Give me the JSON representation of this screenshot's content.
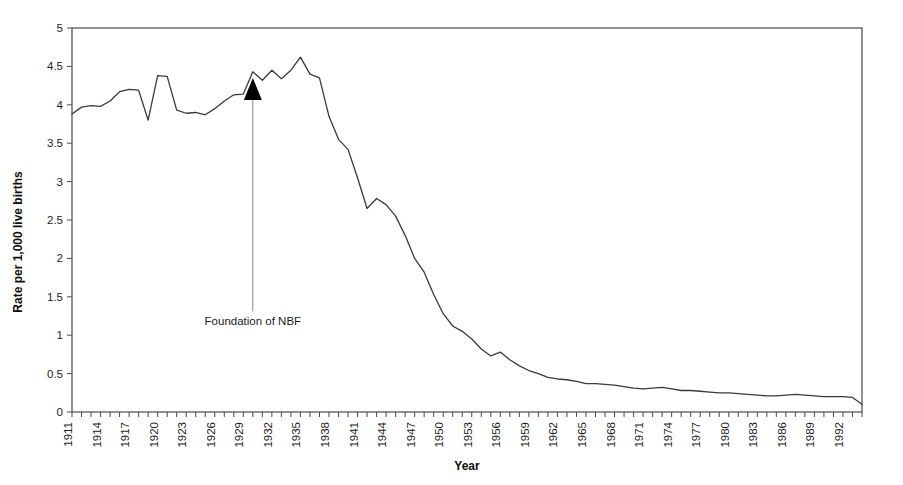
{
  "chart_data": {
    "type": "line",
    "title": "",
    "xlabel": "Year",
    "ylabel": "Rate per 1,000 live births",
    "xlim": [
      1911,
      1994
    ],
    "ylim": [
      0,
      5
    ],
    "grid": false,
    "legend": false,
    "y_ticks": [
      "0",
      "0.5",
      "1",
      "1.5",
      "2",
      "2.5",
      "3",
      "3.5",
      "4",
      "4.5",
      "5"
    ],
    "y_tick_values": [
      0,
      0.5,
      1,
      1.5,
      2,
      2.5,
      3,
      3.5,
      4,
      4.5,
      5
    ],
    "x_tick_labels": [
      "1911",
      "1914",
      "1917",
      "1920",
      "1923",
      "1926",
      "1929",
      "1932",
      "1935",
      "1938",
      "1941",
      "1944",
      "1947",
      "1950",
      "1953",
      "1956",
      "1959",
      "1962",
      "1965",
      "1968",
      "1971",
      "1974",
      "1977",
      "1980",
      "1983",
      "1986",
      "1989",
      "1992"
    ],
    "x_tick_label_step": 3,
    "x_minor_tick_step": 1,
    "series": [
      {
        "name": "Rate per 1,000 live births",
        "color": "#3a3a3a",
        "x": [
          1911,
          1912,
          1913,
          1914,
          1915,
          1916,
          1917,
          1918,
          1919,
          1920,
          1921,
          1922,
          1923,
          1924,
          1925,
          1926,
          1927,
          1928,
          1929,
          1930,
          1931,
          1932,
          1933,
          1934,
          1935,
          1936,
          1937,
          1938,
          1939,
          1940,
          1941,
          1942,
          1943,
          1944,
          1945,
          1946,
          1947,
          1948,
          1949,
          1950,
          1951,
          1952,
          1953,
          1954,
          1955,
          1956,
          1957,
          1958,
          1959,
          1960,
          1961,
          1962,
          1963,
          1964,
          1965,
          1966,
          1967,
          1968,
          1969,
          1970,
          1971,
          1972,
          1973,
          1974,
          1975,
          1976,
          1977,
          1978,
          1979,
          1980,
          1981,
          1982,
          1983,
          1984,
          1985,
          1986,
          1987,
          1988,
          1989,
          1990,
          1991,
          1992,
          1993,
          1994
        ],
        "values": [
          3.88,
          3.97,
          3.99,
          3.98,
          4.05,
          4.17,
          4.2,
          4.19,
          3.8,
          4.38,
          4.37,
          3.93,
          3.89,
          3.9,
          3.87,
          3.95,
          4.05,
          4.13,
          4.14,
          4.43,
          4.32,
          4.45,
          4.34,
          4.45,
          4.62,
          4.4,
          4.35,
          3.85,
          3.55,
          3.42,
          3.05,
          2.65,
          2.78,
          2.7,
          2.55,
          2.3,
          2.0,
          1.82,
          1.53,
          1.28,
          1.12,
          1.05,
          0.95,
          0.82,
          0.73,
          0.78,
          0.68,
          0.6,
          0.54,
          0.5,
          0.45,
          0.43,
          0.42,
          0.4,
          0.37,
          0.37,
          0.36,
          0.35,
          0.33,
          0.31,
          0.3,
          0.31,
          0.32,
          0.3,
          0.28,
          0.28,
          0.27,
          0.26,
          0.25,
          0.25,
          0.24,
          0.23,
          0.22,
          0.21,
          0.21,
          0.22,
          0.23,
          0.22,
          0.21,
          0.2,
          0.2,
          0.2,
          0.19,
          0.1
        ]
      }
    ],
    "annotations": [
      {
        "text": "Foundation of NBF",
        "points_to_year": 1930,
        "points_to_value": 4.35,
        "label_year": 1930,
        "label_value": 1.18,
        "arrow": "up"
      }
    ]
  }
}
